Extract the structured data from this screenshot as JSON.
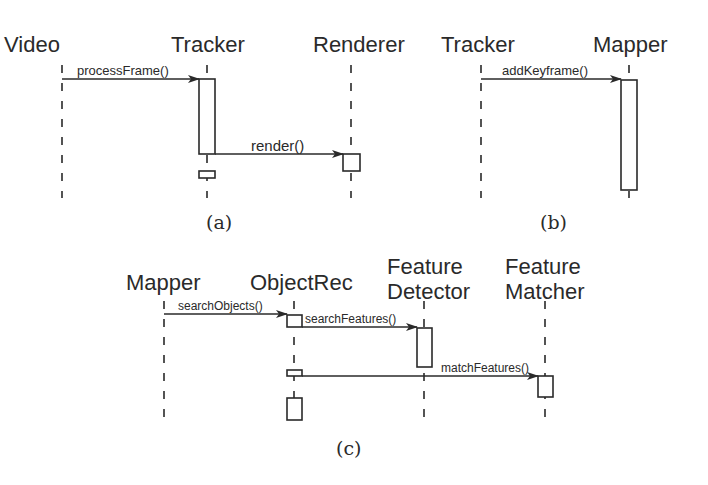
{
  "diagrams": [
    {
      "caption": "(a)",
      "participants": [
        "Video",
        "Tracker",
        "Renderer"
      ],
      "messages": [
        {
          "from": "Video",
          "to": "Tracker",
          "label": "processFrame()"
        },
        {
          "from": "Tracker",
          "to": "Renderer",
          "label": "render()"
        }
      ]
    },
    {
      "caption": "(b)",
      "participants": [
        "Tracker",
        "Mapper"
      ],
      "messages": [
        {
          "from": "Tracker",
          "to": "Mapper",
          "label": "addKeyframe()"
        }
      ]
    },
    {
      "caption": "(c)",
      "participants": [
        "Mapper",
        "ObjectRec",
        "Feature Detector",
        "Feature Matcher"
      ],
      "participant_lines": {
        "feature_detector": [
          "Feature",
          "Detector"
        ],
        "feature_matcher": [
          "Feature",
          "Matcher"
        ]
      },
      "messages": [
        {
          "from": "Mapper",
          "to": "ObjectRec",
          "label": "searchObjects()"
        },
        {
          "from": "ObjectRec",
          "to": "Feature Detector",
          "label": "searchFeatures()"
        },
        {
          "from": "ObjectRec",
          "to": "Feature Matcher",
          "label": "matchFeatures()"
        }
      ]
    }
  ]
}
